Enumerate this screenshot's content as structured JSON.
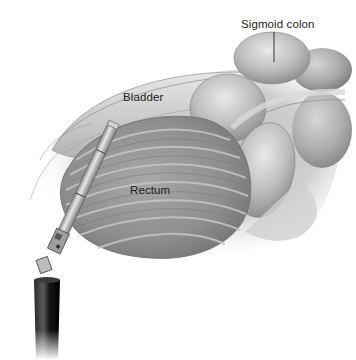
{
  "figure": {
    "palette": {
      "background": "#ffffff",
      "tissue_light": "#dcdcdc",
      "tissue_mid": "#a9a9a9",
      "tissue_dark": "#6e6e6e",
      "instrument_metal": "#b8b8b8",
      "instrument_shaft": "#1a1a1a",
      "label_text": "#1e1e1e"
    },
    "labels": [
      {
        "id": "sigmoid",
        "text": "Sigmoid colon",
        "has_leader_line": true
      },
      {
        "id": "bladder",
        "text": "Bladder",
        "has_leader_line": false
      },
      {
        "id": "rectum",
        "text": "Rectum",
        "has_leader_line": false
      }
    ]
  }
}
